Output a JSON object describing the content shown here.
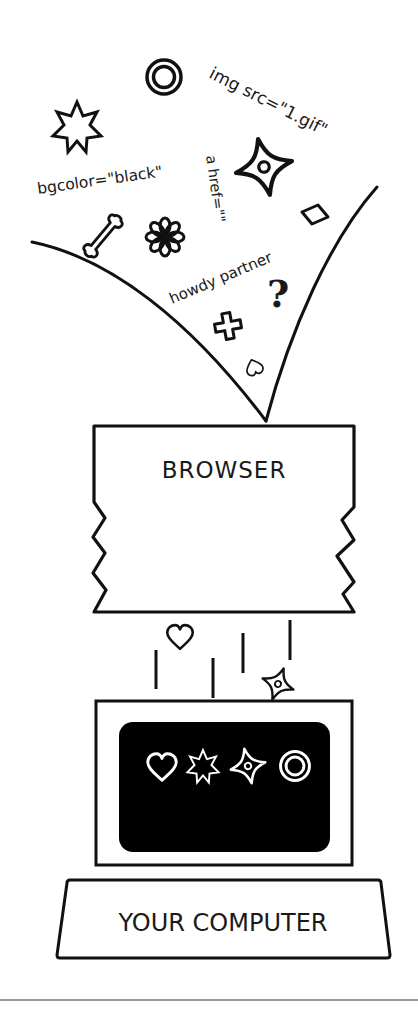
{
  "diagram": {
    "funnel": {
      "labels": [
        {
          "id": "img",
          "text": "img src=\"1.gif\""
        },
        {
          "id": "bgcolor",
          "text": "bgcolor=\"black\""
        },
        {
          "id": "href",
          "text": "a href=\"\""
        },
        {
          "id": "howdy",
          "text": "howdy partner"
        }
      ],
      "icons": [
        "ring-icon",
        "burst-star-icon",
        "sparkle-icon",
        "diamond-icon",
        "bone-icon",
        "flower-icon",
        "question-mark-icon",
        "cross-icon",
        "small-heart-icon"
      ]
    },
    "browser": {
      "label": "BROWSER"
    },
    "falling": {
      "icons": [
        "heart-icon",
        "sparkle-icon"
      ]
    },
    "monitor": {
      "screen_color": "#000000",
      "screen_icons": [
        "heart-icon",
        "burst-star-icon",
        "sparkle-icon",
        "ring-icon"
      ]
    },
    "base": {
      "label": "YOUR COMPUTER"
    },
    "colors": {
      "ink": "#111111",
      "background": "#ffffff",
      "divider": "#777777"
    }
  }
}
